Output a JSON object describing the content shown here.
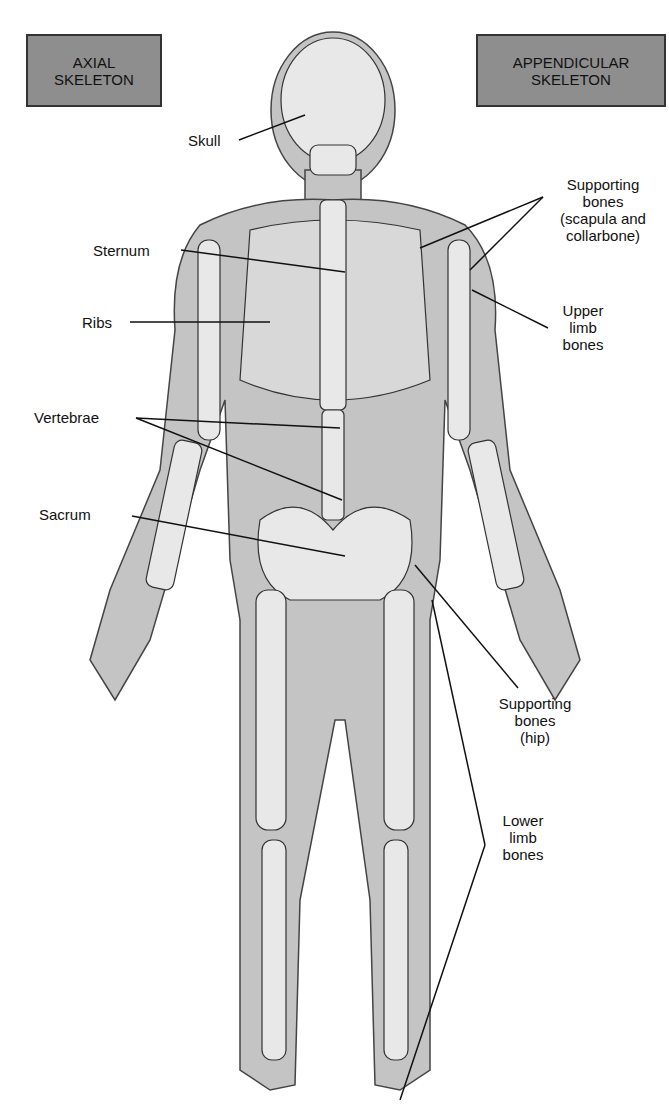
{
  "boxes": {
    "axial": {
      "line1": "AXIAL",
      "line2": "SKELETON"
    },
    "appendicular": {
      "line1": "APPENDICULAR",
      "line2": "SKELETON"
    }
  },
  "labels": {
    "skull": "Skull",
    "sternum": "Sternum",
    "ribs": "Ribs",
    "vertebrae": "Vertebrae",
    "sacrum": "Sacrum",
    "supporting_shoulder": {
      "l1": "Supporting",
      "l2": "bones",
      "l3": "(scapula and",
      "l4": "collarbone)"
    },
    "upper_limb": {
      "l1": "Upper",
      "l2": "limb",
      "l3": "bones"
    },
    "supporting_hip": {
      "l1": "Supporting",
      "l2": "bones",
      "l3": "(hip)"
    },
    "lower_limb": {
      "l1": "Lower",
      "l2": "limb",
      "l3": "bones"
    }
  },
  "colors": {
    "box_fill": "#8e8e8e",
    "body": "#c8c8c8",
    "bone": "#e6e6e6",
    "outline": "#333333"
  }
}
